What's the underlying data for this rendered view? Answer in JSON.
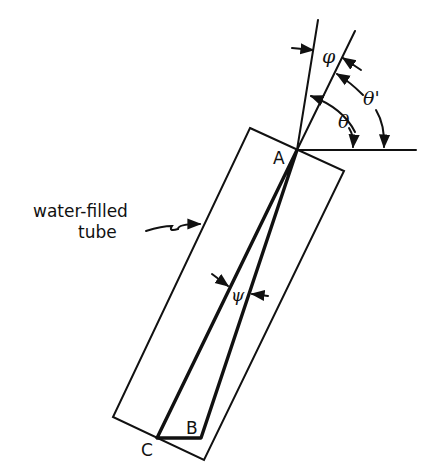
{
  "diagram": {
    "labels": {
      "tube_line1": "water-filled",
      "tube_line2": "tube",
      "point_a": "A",
      "point_b": "B",
      "point_c": "C",
      "phi": "φ",
      "theta": "θ",
      "theta_prime": "θ'",
      "psi": "ψ"
    },
    "colors": {
      "ink": "#111111",
      "background": "#ffffff"
    }
  }
}
